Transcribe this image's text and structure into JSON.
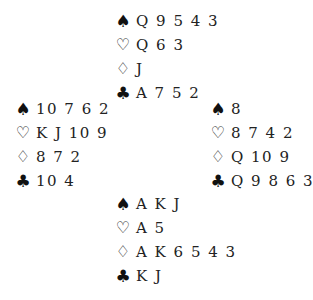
{
  "suits": {
    "spades": "♠",
    "hearts": "♡",
    "diamonds": "♢",
    "clubs": "♣"
  },
  "hands": {
    "north": {
      "spades": "Q 9 5 4 3",
      "hearts": "Q 6 3",
      "diamonds": "J",
      "clubs": "A 7 5 2"
    },
    "west": {
      "spades": "10 7 6 2",
      "hearts": "K J 10 9",
      "diamonds": "8 7 2",
      "clubs": "10 4"
    },
    "east": {
      "spades": "8",
      "hearts": "8 7 4 2",
      "diamonds": "Q 10 9",
      "clubs": "Q 9 8 6 3"
    },
    "south": {
      "spades": "A K J",
      "hearts": "A 5",
      "diamonds": "A K 6 5 4 3",
      "clubs": "K J"
    }
  }
}
